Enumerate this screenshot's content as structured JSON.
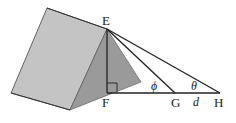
{
  "diagram": {
    "type": "geometry",
    "points": {
      "E": {
        "label": "E",
        "x": 107,
        "y": 29
      },
      "F": {
        "label": "F",
        "x": 107,
        "y": 93
      },
      "G": {
        "label": "G",
        "x": 175,
        "y": 93
      },
      "H": {
        "label": "H",
        "x": 220,
        "y": 93
      }
    },
    "angles": {
      "phi": {
        "label": "ϕ",
        "at": "G"
      },
      "theta": {
        "label": "θ",
        "at": "H"
      }
    },
    "lengths": {
      "GH": {
        "label": "d"
      }
    },
    "right_angle_at": "F",
    "colors": {
      "roof_face": "#c4c4c4",
      "front_face": "#9a9a9a",
      "lines": "#222222",
      "background": "#ffffff"
    }
  }
}
